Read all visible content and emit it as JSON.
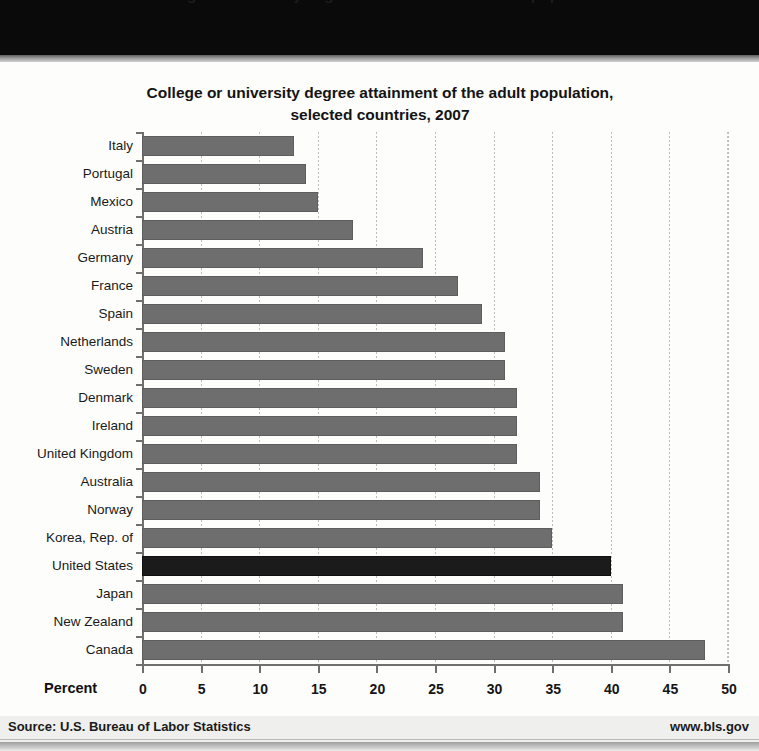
{
  "top_band": {
    "partial_text": "College or university degree attainment of the adult population"
  },
  "footer": {
    "source": "Source: U.S. Bureau of Labor Statistics",
    "url": "www.bls.gov"
  },
  "chart_data": {
    "type": "bar",
    "orientation": "horizontal",
    "title": "College or university degree attainment of the adult population, selected countries, 2007",
    "title_line1": "College or university degree attainment of the adult population,",
    "title_line2": "selected countries, 2007",
    "xlabel": "Percent",
    "ylabel": "",
    "xlim": [
      0,
      50
    ],
    "xticks": [
      0,
      5,
      10,
      15,
      20,
      25,
      30,
      35,
      40,
      45,
      50
    ],
    "xticklabels": [
      "0",
      "5",
      "10",
      "15",
      "20",
      "25",
      "30",
      "35",
      "40",
      "45",
      "50"
    ],
    "grid": true,
    "grid_axis": "x",
    "legend": false,
    "bar_color": "#6e6e6e",
    "highlight_color": "#1b1b1b",
    "highlight_category": "United States",
    "categories": [
      "Italy",
      "Portugal",
      "Mexico",
      "Austria",
      "Germany",
      "France",
      "Spain",
      "Netherlands",
      "Sweden",
      "Denmark",
      "Ireland",
      "United Kingdom",
      "Australia",
      "Norway",
      "Korea, Rep. of",
      "United States",
      "Japan",
      "New Zealand",
      "Canada"
    ],
    "values": [
      13,
      14,
      15,
      18,
      24,
      27,
      29,
      31,
      31,
      32,
      32,
      32,
      34,
      34,
      35,
      40,
      41,
      41,
      48
    ]
  }
}
